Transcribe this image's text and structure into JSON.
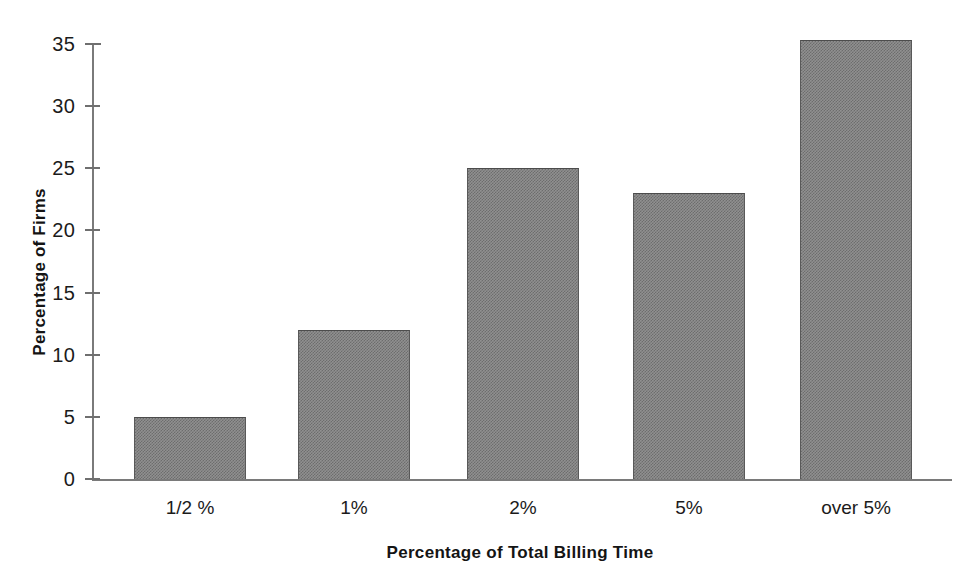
{
  "chart_data": {
    "type": "bar",
    "title": "",
    "xlabel": "Percentage of Total Billing Time",
    "ylabel": "Percentage of Firms",
    "categories": [
      "1/2 %",
      "1%",
      "2%",
      "5%",
      "over 5%"
    ],
    "values": [
      5,
      12,
      25,
      23,
      35.3
    ],
    "ylim": [
      0,
      35
    ],
    "ytick_labels": [
      "0",
      "5",
      "10",
      "15",
      "20",
      "25",
      "30",
      "35"
    ],
    "ytick_values": [
      0,
      5,
      10,
      15,
      20,
      25,
      30,
      35
    ],
    "grid": false,
    "legend": "none",
    "bar_color": "#909090",
    "bar_edge_color": "#4c4c4c",
    "axis_color": "#7a7a7a",
    "text_color": "#1b1b1b",
    "background": "#ffffff"
  }
}
